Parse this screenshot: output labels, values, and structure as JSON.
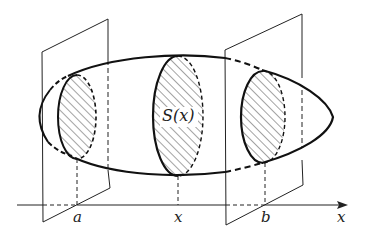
{
  "diagram": {
    "labels": {
      "cross_section": "S(x)",
      "point_a": "a",
      "point_x": "x",
      "point_b": "b",
      "axis": "x"
    },
    "colors": {
      "stroke": "#222222",
      "background": "#ffffff"
    }
  }
}
